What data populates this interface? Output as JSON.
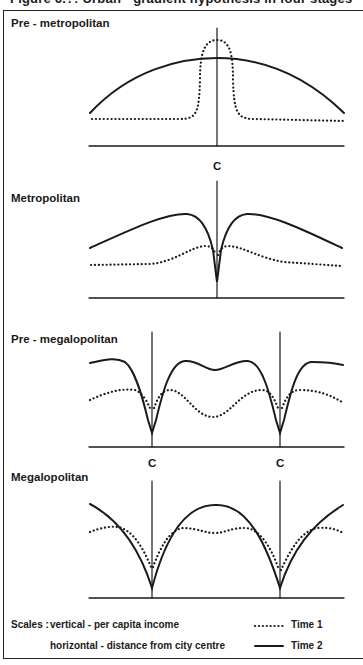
{
  "figure": {
    "title": "Figure 6.?: Urban - gradient hypothesis in four stages"
  },
  "stages": [
    {
      "label": "Pre - metropolitan"
    },
    {
      "label": "Metropolitan"
    },
    {
      "label": "Pre - megalopolitan"
    },
    {
      "label": "Megalopolitan"
    }
  ],
  "centre_marker": "C",
  "legend": {
    "scales_label": "Scales :",
    "vertical": "vertical - per capita income",
    "horizontal": "horizontal - distance from city centre",
    "time1_label": "Time  1",
    "time2_label": "Time  2",
    "time1_style": "dotted",
    "time2_style": "solid"
  },
  "colors": {
    "ink": "#1a1a1a",
    "background": "#ffffff"
  }
}
